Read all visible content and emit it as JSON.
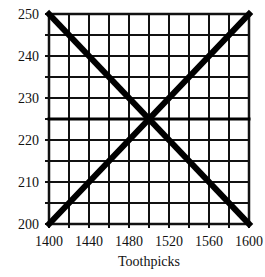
{
  "chart_data": {
    "type": "line",
    "title": "",
    "xlabel": "Toothpicks",
    "ylabel": "",
    "xlim": [
      1400,
      1600
    ],
    "ylim": [
      200,
      250
    ],
    "x_ticks": [
      1400,
      1440,
      1480,
      1520,
      1560,
      1600
    ],
    "y_ticks": [
      200,
      210,
      220,
      230,
      240,
      250
    ],
    "x_minor_step": 20,
    "y_minor_step": 5,
    "grid": true,
    "legend": null,
    "series": [
      {
        "name": "Decreasing line",
        "x": [
          1400,
          1600
        ],
        "y": [
          250,
          200
        ]
      },
      {
        "name": "Increasing line",
        "x": [
          1400,
          1600
        ],
        "y": [
          200,
          250
        ]
      },
      {
        "name": "Horizontal line",
        "x": [
          1400,
          1600
        ],
        "y": [
          225,
          225
        ]
      }
    ],
    "intersection": {
      "x": 1500,
      "y": 225
    }
  }
}
